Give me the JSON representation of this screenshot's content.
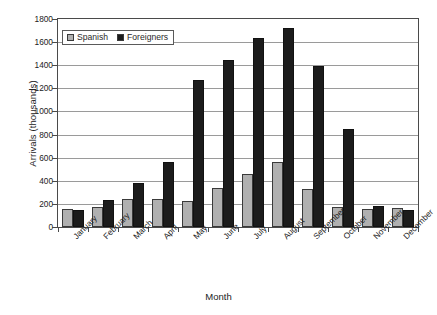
{
  "chart_data": {
    "type": "bar",
    "title": "",
    "xlabel": "Month",
    "ylabel": "Arrivals (thousands)",
    "ylim": [
      0,
      1800
    ],
    "ytick_step": 200,
    "yticks": [
      0,
      200,
      400,
      600,
      800,
      1000,
      1200,
      1400,
      1600,
      1800
    ],
    "grid": true,
    "legend_position": "upper left inside",
    "categories": [
      "January",
      "February",
      "March",
      "April",
      "May",
      "June",
      "July",
      "August",
      "September",
      "October",
      "November",
      "December"
    ],
    "series": [
      {
        "name": "Spanish",
        "color": "#b0b0b0",
        "values": [
          160,
          170,
          245,
          240,
          225,
          340,
          460,
          565,
          325,
          170,
          160,
          165
        ]
      },
      {
        "name": "Foreigners",
        "color": "#1c1c1c",
        "values": [
          145,
          235,
          380,
          560,
          1275,
          1445,
          1640,
          1720,
          1390,
          850,
          180,
          150
        ]
      }
    ]
  },
  "legend": {
    "items": [
      {
        "label": "Spanish"
      },
      {
        "label": "Foreigners"
      }
    ]
  },
  "axes": {
    "y_title": "Arrivals (thousands)",
    "x_title": "Month"
  }
}
